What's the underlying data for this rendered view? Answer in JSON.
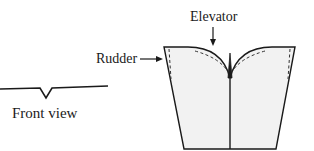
{
  "labels": {
    "elevator": "Elevator",
    "rudder": "Rudder",
    "front_view": "Front view"
  },
  "colors": {
    "stroke": "#1a1a1a",
    "fill": "#f2f2f2",
    "dashed": "#333333",
    "background": "#ffffff"
  }
}
